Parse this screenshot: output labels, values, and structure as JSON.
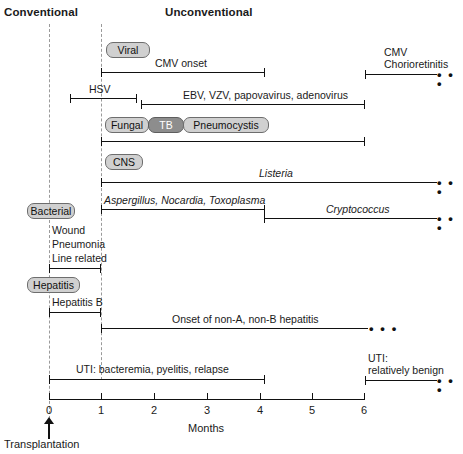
{
  "figure": {
    "title_left": "Conventional",
    "title_right": "Unconventional",
    "axis_title": "Months",
    "tick_labels": [
      "0",
      "1",
      "2",
      "3",
      "4",
      "5",
      "6"
    ],
    "origin_marker": "Transplantation"
  },
  "categories": [
    {
      "key": "viral",
      "label": "Viral"
    },
    {
      "key": "fungal",
      "label": "Fungal"
    },
    {
      "key": "tb",
      "label": "TB"
    },
    {
      "key": "pcp",
      "label": "Pneumocystis"
    },
    {
      "key": "cns",
      "label": "CNS"
    },
    {
      "key": "bacterial",
      "label": "Bacterial"
    },
    {
      "key": "hepatitis",
      "label": "Hepatitis"
    }
  ],
  "intervals": [
    {
      "label": "CMV onset",
      "start_month": 1.0,
      "end_month": 4.1,
      "italic": false,
      "open_ended": false,
      "label_align": "center"
    },
    {
      "label": "CMV\nChorioretinitis",
      "start_month": 6.0,
      "end_month": 7.6,
      "italic": false,
      "open_ended": true,
      "label_align": "left"
    },
    {
      "label": "HSV",
      "start_month": 0.4,
      "end_month": 1.68,
      "italic": false,
      "open_ended": false,
      "label_align": "center"
    },
    {
      "label": "EBV, VZV, papovavirus, adenovirus",
      "start_month": 1.75,
      "end_month": 6.0,
      "italic": false,
      "open_ended": false,
      "label_align": "center"
    },
    {
      "label": "",
      "start_month": 1.0,
      "end_month": 6.0,
      "italic": false,
      "open_ended": false,
      "label_align": "center"
    },
    {
      "label": "Listeria",
      "start_month": 1.0,
      "end_month": 7.6,
      "italic": true,
      "open_ended": true,
      "label_align": "center"
    },
    {
      "label": "Aspergillus, Nocardia, Toxoplasma",
      "start_month": 1.0,
      "end_month": 4.1,
      "italic": true,
      "open_ended": false,
      "label_align": "left"
    },
    {
      "label": "Cryptococcus",
      "start_month": 4.1,
      "end_month": 7.6,
      "italic": true,
      "open_ended": true,
      "label_align": "center"
    },
    {
      "label": "Wound\nPneumonia\nLine related",
      "start_month": 0.0,
      "end_month": 1.0,
      "italic": false,
      "open_ended": false,
      "label_align": "left"
    },
    {
      "label": "Hepatitis B",
      "start_month": 0.0,
      "end_month": 1.0,
      "italic": false,
      "open_ended": false,
      "label_align": "left"
    },
    {
      "label": "Onset of non-A, non-B hepatitis",
      "start_month": 1.0,
      "end_month": 6.05,
      "italic": false,
      "open_ended": true,
      "label_align": "center"
    },
    {
      "label": "UTI: bacteremia, pyelitis, relapse",
      "start_month": 0.0,
      "end_month": 4.1,
      "italic": false,
      "open_ended": false,
      "label_align": "center"
    },
    {
      "label": "UTI:\nrelatively benign",
      "start_month": 6.0,
      "end_month": 7.6,
      "italic": false,
      "open_ended": true,
      "label_align": "left"
    }
  ],
  "bars": {
    "cmv_onset": "CMV onset",
    "cmv_chorio_l1": "CMV",
    "cmv_chorio_l2": "Chorioretinitis",
    "hsv": "HSV",
    "ebv": "EBV, VZV, papovavirus, adenovirus",
    "listeria": "Listeria",
    "aspergillus": "Aspergillus, Nocardia, Toxoplasma",
    "cryptococcus": "Cryptococcus",
    "wound": "Wound",
    "pneumonia": "Pneumonia",
    "line_related": "Line related",
    "hepatitis_b": "Hepatitis B",
    "nanb": "Onset of non-A, non-B hepatitis",
    "uti_early": "UTI: bacteremia, pyelitis, relapse",
    "uti_late_l1": "UTI:",
    "uti_late_l2": "relatively benign",
    "ellipsis": "• • •"
  },
  "colors": {
    "badge_fill": "#d0d0d0",
    "badge_fill_dark": "#8d8d8d",
    "badge_border": "#6d6d6d",
    "line": "#111111",
    "dashed_guide": "#9a9a9a",
    "background": "#ffffff"
  }
}
